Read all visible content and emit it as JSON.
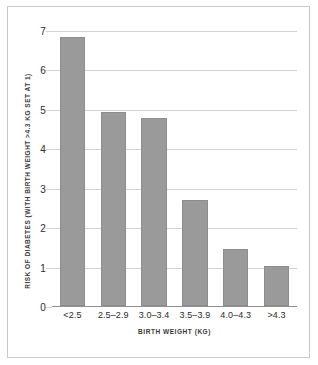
{
  "chart_data": {
    "type": "bar",
    "title": "",
    "subtitle": "",
    "xlabel": "BIRTH WEIGHT (KG)",
    "ylabel": "RISK OF DIABETES (WITH BIRTH WEIGHT >4.3 KG SET AT 1)",
    "categories": [
      "<2.5",
      "2.5–2.9",
      "3.0–3.4",
      "3.5–3.9",
      "4.0–4.3",
      ">4.3"
    ],
    "values": [
      6.85,
      4.95,
      4.78,
      2.7,
      1.45,
      1.03
    ],
    "ylim": [
      0,
      7
    ],
    "ytick_labels": [
      "7",
      "6",
      "5",
      "4",
      "3",
      "2",
      "1",
      "0"
    ],
    "ytick_values": [
      7,
      6,
      5,
      4,
      3,
      2,
      1,
      0
    ],
    "grid": "horizontal",
    "legend": "none",
    "bar_color": "#9a9a9a",
    "grid_color": "#d2d2d2",
    "axis_color": "#8f8f8f",
    "frame_color": "#c9c9c9",
    "background": "#ffffff"
  }
}
